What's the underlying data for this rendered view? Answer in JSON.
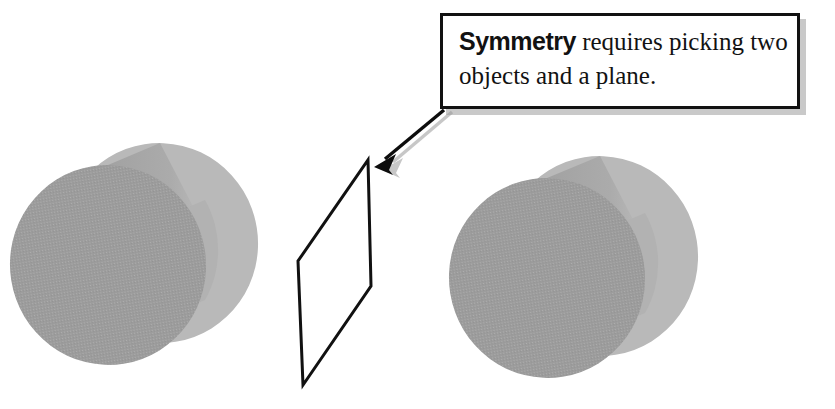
{
  "canvas": {
    "width": 835,
    "height": 409,
    "background": "#ffffff"
  },
  "callout": {
    "name": "symmetry-callout",
    "lead_word": "Symmetry",
    "body_text": " requires picking two objects and a plane.",
    "full_text": "Symmetry requires picking two objects and a plane.",
    "border_color": "#111111",
    "fill_color": "#ffffff",
    "shadow_color": "#c9c9c9",
    "text_color": "#121212",
    "box": {
      "x": 440,
      "y": 13,
      "width": 360,
      "height": 96
    }
  },
  "pointer": {
    "name": "callout-arrow",
    "color": "#0d0d0d",
    "shadow_color": "#a9a9a9",
    "tail": {
      "x": 443,
      "y": 110
    },
    "tip": {
      "x": 374,
      "y": 156
    }
  },
  "plane": {
    "name": "mirror-plane",
    "stroke_color": "#111111",
    "fill_color": "none",
    "stroke_width": 3,
    "vertices": [
      {
        "x": 368,
        "y": 160
      },
      {
        "x": 371,
        "y": 286
      },
      {
        "x": 303,
        "y": 385
      },
      {
        "x": 298,
        "y": 261
      }
    ]
  },
  "objects": [
    {
      "name": "cylinder-left",
      "side": "left",
      "front_face_color": "#9c9c9c",
      "back_face_color": "#b9b9b9",
      "body_color": "#a8a8a8",
      "front_center": {
        "x": 108,
        "y": 265
      },
      "back_center": {
        "x": 160,
        "y": 243
      },
      "radius_x": 98,
      "radius_y": 100
    },
    {
      "name": "cylinder-right",
      "side": "right",
      "front_face_color": "#9c9c9c",
      "back_face_color": "#b9b9b9",
      "body_color": "#a8a8a8",
      "front_center": {
        "x": 547,
        "y": 278
      },
      "back_center": {
        "x": 600,
        "y": 256
      },
      "radius_x": 98,
      "radius_y": 100
    }
  ],
  "labels": {
    "diagram_title": "Symmetry requires picking two objects and a plane.",
    "object_count": 2,
    "plane_count": 1
  }
}
